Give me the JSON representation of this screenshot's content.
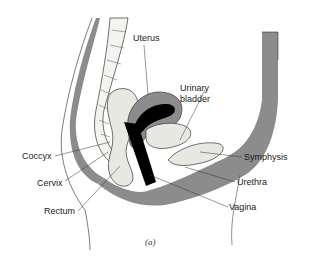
{
  "figure": {
    "caption": "(a)",
    "labels": {
      "uterus": "Uterus",
      "urinary_bladder_line1": "Urinary",
      "urinary_bladder_line2": "bladder",
      "coccyx": "Coccyx",
      "cervix": "Cervix",
      "rectum": "Rectum",
      "symphysis": "Symphysis",
      "urethra": "Urethra",
      "vagina": "Vagina"
    },
    "colors": {
      "tissue": "#8c8c8c",
      "tissue_light": "#c8c8c8",
      "organ_fill": "#e8e8e2",
      "lumen": "#000000",
      "outline": "#333333"
    }
  }
}
